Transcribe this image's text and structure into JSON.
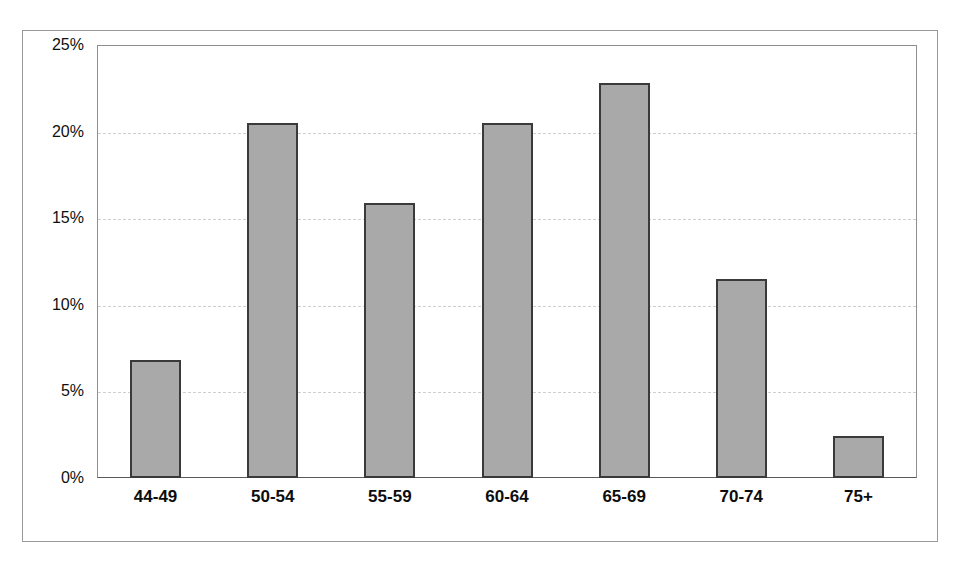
{
  "chart_data": {
    "type": "bar",
    "title": "",
    "subtitle": "",
    "xlabel": "",
    "ylabel": "",
    "categories": [
      "44-49",
      "50-54",
      "55-59",
      "60-64",
      "65-69",
      "70-74",
      "75+"
    ],
    "values": [
      6.8,
      20.5,
      15.9,
      20.5,
      22.8,
      11.5,
      2.4
    ],
    "value_labels": [
      "6.8%",
      "20.5%",
      "15.9%",
      "20.5%",
      "22.8%",
      "11.5%",
      "2.4%"
    ],
    "ylim": [
      0,
      25
    ],
    "ytick_values": [
      0,
      5,
      10,
      15,
      20,
      25
    ],
    "ytick_labels": [
      "0%",
      "5%",
      "10%",
      "15%",
      "20%",
      "25%"
    ],
    "grid": true,
    "grid_axis": "y",
    "grid_style": "dashed",
    "legend": false,
    "legend_position": "none",
    "bar_fill_color": "#a9a9a9",
    "bar_edge_color": "#3a3a3a",
    "gridline_color": "#cfcfcf",
    "axis_color": "#8e8e8e",
    "frame_color": "#9a9a9a",
    "plot_background": "#ffffff"
  }
}
